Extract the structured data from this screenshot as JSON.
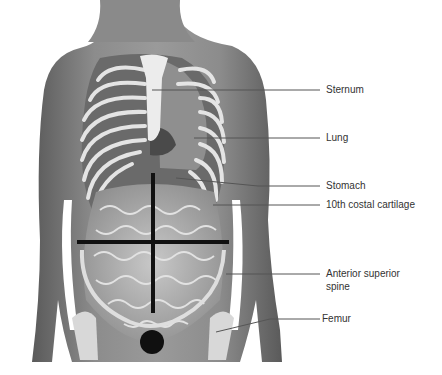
{
  "figure": {
    "colors": {
      "skin": "#8a8a8a",
      "skin_dark": "#5e5e5e",
      "bone": "#e6e6e6",
      "organ": "#9c9c9c",
      "intestine": "#bdbdbd",
      "quadrant_line": "#111111",
      "leader_line": "#555555",
      "label_text": "#333333"
    }
  },
  "labels": [
    {
      "id": "sternum",
      "text": "Sternum"
    },
    {
      "id": "lung",
      "text": "Lung"
    },
    {
      "id": "stomach",
      "text": "Stomach"
    },
    {
      "id": "costal",
      "text": "10th costal cartilage"
    },
    {
      "id": "asis_line1",
      "text": "Anterior superior"
    },
    {
      "id": "asis_line2",
      "text": "spine"
    },
    {
      "id": "femur",
      "text": "Femur"
    }
  ]
}
